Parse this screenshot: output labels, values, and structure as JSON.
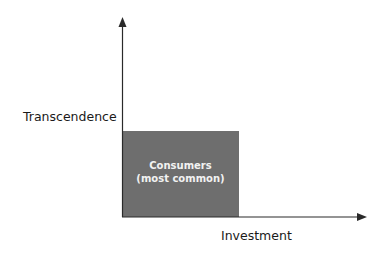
{
  "diagram": {
    "y_axis_label": "Transcendence",
    "x_axis_label": "Investment",
    "region": {
      "title": "Consumers",
      "subtitle": "(most common)",
      "fill_color": "#6e6e6e"
    },
    "axis_color": "#2a2a2a"
  }
}
